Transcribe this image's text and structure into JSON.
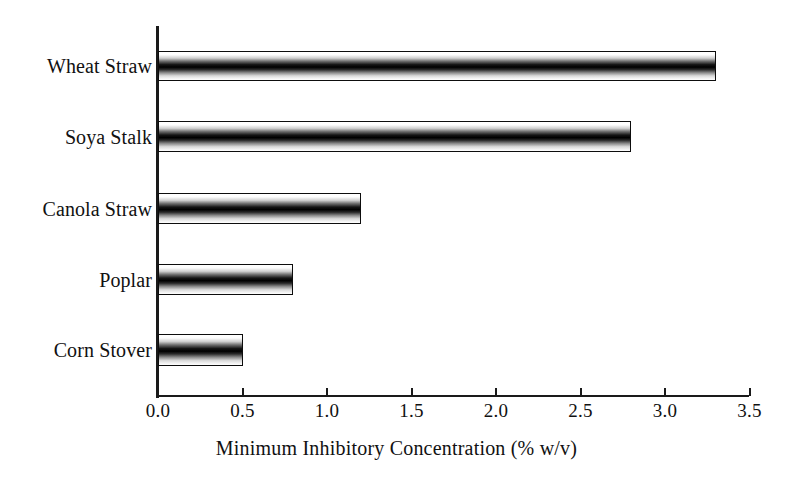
{
  "chart_data": {
    "type": "bar",
    "orientation": "horizontal",
    "title": "",
    "subtitle": "",
    "xlabel": "Minimum Inhibitory Concentration (% w/v)",
    "ylabel": "",
    "categories": [
      "Wheat Straw",
      "Soya Stalk",
      "Canola Straw",
      "Poplar",
      "Corn Stover"
    ],
    "values": [
      3.3,
      2.8,
      1.2,
      0.8,
      0.5
    ],
    "xlim": [
      0.0,
      3.5
    ],
    "xticks": [
      "0.0",
      "0.5",
      "1.0",
      "1.5",
      "2.0",
      "2.5",
      "3.0",
      "3.5"
    ],
    "xtick_values": [
      0.0,
      0.5,
      1.0,
      1.5,
      2.0,
      2.5,
      3.0,
      3.5
    ],
    "grid": false,
    "legend": null,
    "annotations": [],
    "bar_fill": "vertical-gradient-white-black-white",
    "bar_edge_color": "#0d0d0d",
    "background_color": "#ffffff",
    "text_color": "#111111"
  },
  "axis": {
    "x_title": "Minimum Inhibitory Concentration (% w/v)"
  },
  "bars": [
    {
      "label": "Wheat Straw",
      "value": 3.3,
      "top": 51,
      "height": 30
    },
    {
      "label": "Soya Stalk",
      "value": 2.8,
      "top": 121,
      "height": 31
    },
    {
      "label": "Canola Straw",
      "value": 1.2,
      "top": 193,
      "height": 31
    },
    {
      "label": "Poplar",
      "value": 0.8,
      "top": 264,
      "height": 31
    },
    {
      "label": "Corn Stover",
      "value": 0.5,
      "top": 334,
      "height": 32
    }
  ]
}
